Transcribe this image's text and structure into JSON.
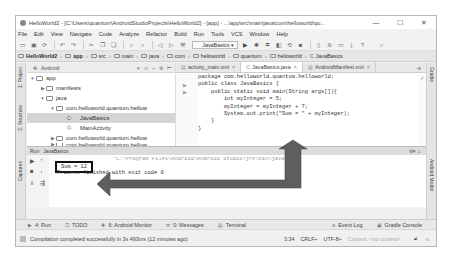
{
  "window": {
    "title": "HelloWorld2 - [C:\\Users\\quantum\\AndroidStudioProjects\\HelloWorld2] - [app] - ...\\app\\src\\main\\java\\com\\helloworld\\qu...",
    "controls": {
      "minimize": "—",
      "maximize": "☐",
      "close": "✕"
    }
  },
  "menu": [
    "File",
    "Edit",
    "View",
    "Navigate",
    "Code",
    "Analyze",
    "Refactor",
    "Build",
    "Run",
    "Tools",
    "VCS",
    "Window",
    "Help"
  ],
  "toolbar": {
    "run_config": "JavaBasics ▾"
  },
  "breadcrumbs": [
    "HelloWorld2",
    "app",
    "src",
    "main",
    "java",
    "com",
    "helloworld",
    "quantum",
    "helloworld",
    "JavaBasics"
  ],
  "left_tool_tabs": [
    "1: Project",
    "2: Structure",
    "Captures"
  ],
  "right_tool_tabs": [
    "Gradle",
    "Android Model"
  ],
  "project": {
    "view_mode": "Android",
    "tree": [
      {
        "label": "app",
        "arrow": "▼",
        "type": "folder",
        "level": 0
      },
      {
        "label": "manifests",
        "arrow": "▶",
        "type": "folder",
        "level": 1
      },
      {
        "label": "java",
        "arrow": "▼",
        "type": "folder",
        "level": 1
      },
      {
        "label": "com.helloworld.quantum.hellow",
        "arrow": "▼",
        "type": "package",
        "level": 2
      },
      {
        "label": "JavaBasics",
        "arrow": "",
        "type": "class",
        "level": 3,
        "selected": true
      },
      {
        "label": "MainActivity",
        "arrow": "",
        "type": "class",
        "level": 3
      },
      {
        "label": "com.helloworld.quantum.hellow",
        "arrow": "▶",
        "type": "package",
        "level": 2
      },
      {
        "label": "com.helloworld.quantum.hellow",
        "arrow": "▶",
        "type": "package",
        "level": 2
      }
    ]
  },
  "editor": {
    "tabs": [
      {
        "label": "activity_main.xml",
        "active": false
      },
      {
        "label": "JavaBasics.java",
        "active": true
      },
      {
        "label": "AndroidManifest.xml",
        "active": false
      }
    ],
    "tabs_more": "-≡",
    "code": [
      "package com.helloworld.quantum.helloworld;",
      "public class JavaBasics {",
      "    public static void main(String args[]){",
      "        int myInteger = 5;",
      "        myInteger = myInteger + 7;",
      "        System.out.print(\"Sum = \" + myInteger);",
      "    }",
      "}"
    ]
  },
  "run_panel": {
    "label": "Run",
    "config": "JavaBasics",
    "console": {
      "command_line": "\"C:\\Program Files\\Android\\Android Studio\\jre\\bin\\java\" ...",
      "output": "Sum = 12",
      "process_line": "Process finished with exit code 0"
    }
  },
  "bottom_tabs": [
    {
      "label": "4: Run",
      "icon": "▶"
    },
    {
      "label": "TODO",
      "icon": "☑"
    },
    {
      "label": "6: Android Monitor",
      "icon": "✚"
    },
    {
      "label": "0: Messages",
      "icon": "✉"
    },
    {
      "label": "Terminal",
      "icon": "▤"
    },
    {
      "label": "Event Log",
      "icon": "≡"
    },
    {
      "label": "Gradle Console",
      "icon": "▣"
    }
  ],
  "status": {
    "message": "Compilation completed successfully in 3s 493ms (12 minutes ago)",
    "position": "3:34",
    "line_sep": "CRLF÷",
    "encoding": "UTF-8÷",
    "context": "Context: <no context>"
  }
}
